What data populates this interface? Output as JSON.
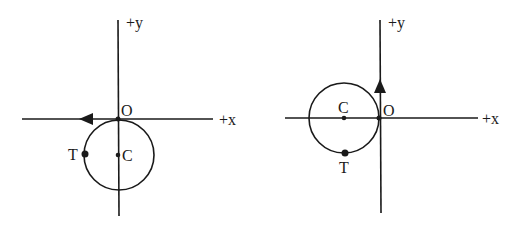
{
  "diagrams": [
    {
      "id": "left",
      "labels": {
        "y_axis": "+y",
        "x_axis": "+x",
        "origin": "O",
        "center": "C",
        "point": "T"
      },
      "arrow_direction": "left (along -x axis)",
      "description": "Circle tangent to x-axis at origin O, center C on negative y-axis, point T at leftmost point of circle"
    },
    {
      "id": "right",
      "labels": {
        "y_axis": "+y",
        "x_axis": "+x",
        "origin": "O",
        "center": "C",
        "point": "T"
      },
      "arrow_direction": "up (along +y axis)",
      "description": "Circle tangent to y-axis at origin O, center C on negative x-axis, point T at bottom point of circle"
    }
  ]
}
